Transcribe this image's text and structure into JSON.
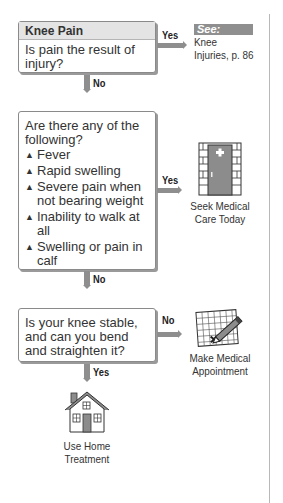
{
  "flowchart": {
    "q1": {
      "header": "Knee Pain",
      "question": "Is pain the result of injury?",
      "yes_label": "Yes",
      "no_label": "No",
      "see": {
        "tag": "See:",
        "line1": "Knee",
        "line2": "Injuries, p. 86"
      }
    },
    "q2": {
      "question": "Are there any of the following?",
      "items": [
        "Fever",
        "Rapid swelling",
        "Severe pain when not bearing weight",
        "Inability to walk at all",
        "Swelling or pain in calf"
      ],
      "bullet": "▲",
      "yes_label": "Yes",
      "no_label": "No",
      "outcome": {
        "icon": "hospital-door-icon",
        "line1": "Seek Medical",
        "line2": "Care Today"
      }
    },
    "q3": {
      "question": "Is your knee stable, and can you bend and straighten it?",
      "no_label": "No",
      "yes_label": "Yes",
      "no_outcome": {
        "icon": "calendar-pencil-icon",
        "line1": "Make Medical",
        "line2": "Appointment"
      },
      "yes_outcome": {
        "icon": "house-icon",
        "line1": "Use Home",
        "line2": "Treatment"
      }
    }
  }
}
